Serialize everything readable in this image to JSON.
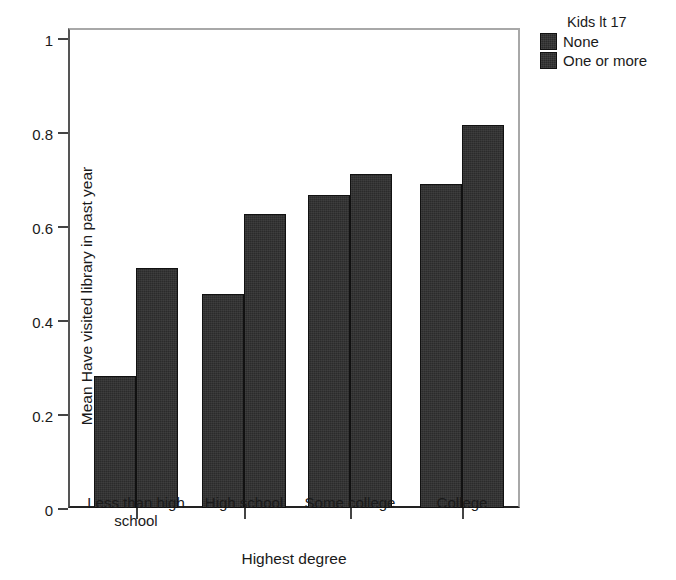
{
  "chart_data": {
    "type": "bar",
    "title": "",
    "xlabel": "Highest degree",
    "ylabel": "Mean Have visited library in past year",
    "categories": [
      "Less than high school",
      "High school",
      "Some college",
      "College"
    ],
    "series": [
      {
        "name": "None",
        "values": [
          0.28,
          0.455,
          0.665,
          0.69
        ]
      },
      {
        "name": "One or more",
        "values": [
          0.51,
          0.625,
          0.71,
          0.815
        ]
      }
    ],
    "ylim": [
      0,
      1
    ],
    "yticks": [
      0,
      0.2,
      0.4,
      0.6,
      0.8,
      1
    ],
    "ytick_labels": [
      "0",
      "0.2",
      "0.4",
      "0.6",
      "0.8",
      "1"
    ],
    "grid": false,
    "legend": {
      "title": "Kids lt 17",
      "position": "right",
      "entries": [
        "None",
        "One or more"
      ]
    },
    "bar_color": "#2b2b2b"
  },
  "axis": {
    "x_title": "Highest degree",
    "y_title": "Mean Have visited library in past year",
    "y_labels": [
      "1",
      "0.8",
      "0.6",
      "0.4",
      "0.2",
      "0"
    ],
    "x_labels": [
      "Less than high school",
      "High school",
      "Some college",
      "College"
    ]
  },
  "legend": {
    "title": "Kids lt 17",
    "items": [
      {
        "label": "None"
      },
      {
        "label": "One or more"
      }
    ]
  }
}
